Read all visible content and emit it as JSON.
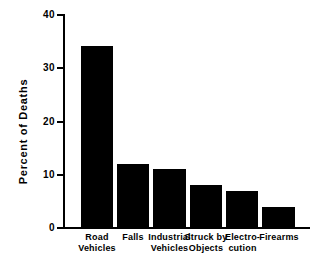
{
  "chart_data": {
    "type": "bar",
    "title": "",
    "subtitle": "",
    "xlabel": "",
    "ylabel": "Percent of Deaths",
    "categories": [
      "Road\nVehicles",
      "Falls",
      "Industrial\nVehicles",
      "Struck by\nObjects",
      "Electro-\ncution",
      "Firearms"
    ],
    "values": [
      34,
      12,
      11,
      8,
      7,
      4
    ],
    "ylim": [
      0,
      40
    ],
    "yticks": [
      0,
      10,
      20,
      30,
      40
    ],
    "ytick_labels": [
      "0",
      "10",
      "20",
      "30",
      "40"
    ],
    "grid": false,
    "legend": false,
    "bar_color": "#000000",
    "background_color": "#ffffff",
    "axis_color": "#000000"
  },
  "axis": {
    "y_title": "Percent of Deaths",
    "tick_0": "0",
    "tick_10": "10",
    "tick_20": "20",
    "tick_30": "30",
    "tick_40": "40"
  },
  "categories": {
    "cat_0": "Road\nVehicles",
    "cat_1": "Falls",
    "cat_2": "Industrial\nVehicles",
    "cat_3": "Struck by\nObjects",
    "cat_4": "Electro-\ncution",
    "cat_5": "Firearms"
  }
}
